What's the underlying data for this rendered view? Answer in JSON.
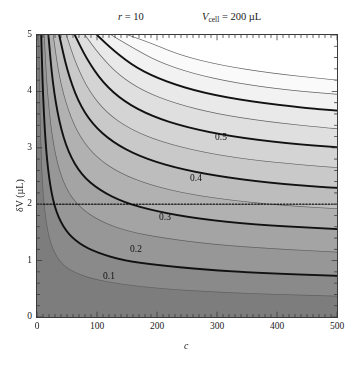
{
  "figure": {
    "annotations": [
      {
        "name": "ratio-annotation",
        "text_italic": "r",
        "text_rest": " = 10",
        "x": 118,
        "y": 17
      },
      {
        "name": "vcell-annotation",
        "text_italic": "V",
        "sub": "cell",
        "text_rest": " = 200 µL",
        "x": 205,
        "y": 17
      }
    ],
    "ylabel": "δV (µL)",
    "xlabel": "c"
  },
  "chart_data": {
    "type": "line",
    "subtype": "contour",
    "title": "",
    "xlabel": "c",
    "ylabel": "δV (µL)",
    "xlim": [
      0,
      500
    ],
    "ylim": [
      0,
      5
    ],
    "xticks": [
      0,
      100,
      200,
      300,
      400,
      500
    ],
    "xtick_labels": [
      "0",
      "100",
      "200",
      "300",
      "400",
      "500"
    ],
    "yticks": [
      0,
      1,
      2,
      3,
      4,
      5
    ],
    "ytick_labels": [
      "0",
      "1",
      "2",
      "3",
      "4",
      "5"
    ],
    "minor_ticks": true,
    "grid": false,
    "legend": null,
    "parameters": {
      "r": 10,
      "V_cell": 200,
      "V_cell_units": "µL"
    },
    "colormap": "grayscale",
    "colormap_note": "dark gray at low values (bottom-left), white at high values (top-right)",
    "shading_levels": [
      {
        "value": 0.0,
        "color": "#7d7d7d"
      },
      {
        "value": 0.05,
        "color": "#8a8a8a"
      },
      {
        "value": 0.1,
        "color": "#979797"
      },
      {
        "value": 0.15,
        "color": "#a4a4a4"
      },
      {
        "value": 0.2,
        "color": "#b1b1b1"
      },
      {
        "value": 0.25,
        "color": "#bdbdbd"
      },
      {
        "value": 0.3,
        "color": "#c9c9c9"
      },
      {
        "value": 0.35,
        "color": "#d4d4d4"
      },
      {
        "value": 0.4,
        "color": "#dfdfdf"
      },
      {
        "value": 0.45,
        "color": "#e9e9e9"
      },
      {
        "value": 0.5,
        "color": "#f2f2f2"
      },
      {
        "value": 0.55,
        "color": "#fafafa"
      },
      {
        "value": 0.6,
        "color": "#ffffff"
      }
    ],
    "contour_levels": [
      0.05,
      0.1,
      0.15,
      0.2,
      0.25,
      0.3,
      0.35,
      0.4,
      0.45,
      0.5,
      0.55,
      0.6
    ],
    "major_contour_levels": [
      0.1,
      0.2,
      0.3,
      0.4,
      0.5
    ],
    "contour_labels": [
      {
        "level": 0.5,
        "text": "0.5",
        "x": 215,
        "y": 139
      },
      {
        "level": 0.4,
        "text": "0.4",
        "x": 190,
        "y": 180
      },
      {
        "level": 0.3,
        "text": "0.3",
        "x": 159,
        "y": 219
      },
      {
        "level": 0.2,
        "text": "0.2",
        "x": 130,
        "y": 251
      },
      {
        "level": 0.1,
        "text": "0.1",
        "x": 103,
        "y": 278
      }
    ],
    "reference_line": {
      "name": "delta-v-reference",
      "orientation": "horizontal",
      "y_value": 2,
      "style": "dotted",
      "color": "#000000"
    },
    "series": [
      {
        "name": "contour-0.05",
        "level": 0.05,
        "x": [
          3,
          5,
          8,
          12,
          18,
          26,
          40,
          60,
          90,
          140,
          210,
          300,
          400,
          500
        ],
        "y": [
          5.0,
          3.6,
          2.55,
          1.95,
          1.5,
          1.2,
          0.95,
          0.8,
          0.68,
          0.58,
          0.5,
          0.44,
          0.4,
          0.37
        ]
      },
      {
        "name": "contour-0.10",
        "level": 0.1,
        "x": [
          7,
          10,
          15,
          22,
          32,
          48,
          70,
          100,
          145,
          200,
          280,
          370,
          500
        ],
        "y": [
          5.0,
          3.9,
          2.95,
          2.3,
          1.85,
          1.52,
          1.3,
          1.14,
          1.0,
          0.92,
          0.84,
          0.78,
          0.73
        ]
      },
      {
        "name": "contour-0.15",
        "level": 0.15,
        "x": [
          12,
          17,
          25,
          36,
          52,
          74,
          105,
          150,
          210,
          290,
          380,
          500
        ],
        "y": [
          5.0,
          4.0,
          3.2,
          2.62,
          2.2,
          1.92,
          1.7,
          1.52,
          1.4,
          1.29,
          1.22,
          1.15
        ]
      },
      {
        "name": "contour-0.20",
        "level": 0.2,
        "x": [
          19,
          26,
          37,
          52,
          74,
          104,
          145,
          200,
          270,
          360,
          460,
          500
        ],
        "y": [
          5.0,
          4.15,
          3.45,
          2.92,
          2.52,
          2.25,
          2.03,
          1.87,
          1.74,
          1.64,
          1.58,
          1.56
        ]
      },
      {
        "name": "contour-0.25",
        "level": 0.25,
        "x": [
          27,
          37,
          52,
          72,
          100,
          138,
          188,
          252,
          330,
          420,
          500
        ],
        "y": [
          5.0,
          4.25,
          3.65,
          3.18,
          2.82,
          2.55,
          2.34,
          2.18,
          2.06,
          1.97,
          1.92
        ]
      },
      {
        "name": "contour-0.30",
        "level": 0.3,
        "x": [
          37,
          50,
          68,
          92,
          126,
          170,
          228,
          300,
          386,
          480,
          500
        ],
        "y": [
          5.0,
          4.38,
          3.83,
          3.42,
          3.1,
          2.85,
          2.65,
          2.5,
          2.38,
          2.3,
          2.29
        ]
      },
      {
        "name": "contour-0.35",
        "level": 0.35,
        "x": [
          49,
          65,
          87,
          116,
          155,
          206,
          272,
          352,
          448,
          500
        ],
        "y": [
          5.0,
          4.48,
          4.0,
          3.62,
          3.33,
          3.11,
          2.93,
          2.79,
          2.69,
          2.65
        ]
      },
      {
        "name": "contour-0.40",
        "level": 0.4,
        "x": [
          63,
          83,
          110,
          145,
          191,
          250,
          325,
          415,
          500
        ],
        "y": [
          5.0,
          4.57,
          4.15,
          3.82,
          3.56,
          3.36,
          3.2,
          3.08,
          3.01
        ]
      },
      {
        "name": "contour-0.45",
        "level": 0.45,
        "x": [
          80,
          104,
          136,
          178,
          232,
          300,
          385,
          485,
          500
        ],
        "y": [
          5.0,
          4.65,
          4.29,
          4.0,
          3.78,
          3.6,
          3.46,
          3.35,
          3.34
        ]
      },
      {
        "name": "contour-0.50",
        "level": 0.5,
        "x": [
          100,
          128,
          166,
          215,
          278,
          356,
          452,
          500
        ],
        "y": [
          5.0,
          4.72,
          4.41,
          4.17,
          3.97,
          3.82,
          3.7,
          3.66
        ]
      },
      {
        "name": "contour-0.55",
        "level": 0.55,
        "x": [
          124,
          157,
          201,
          258,
          330,
          420,
          500
        ],
        "y": [
          5.0,
          4.79,
          4.53,
          4.32,
          4.15,
          4.02,
          3.95
        ]
      },
      {
        "name": "contour-0.60",
        "level": 0.6,
        "x": [
          152,
          191,
          242,
          308,
          391,
          490,
          500
        ],
        "y": [
          5.0,
          4.85,
          4.63,
          4.46,
          4.32,
          4.21,
          4.2
        ]
      }
    ]
  }
}
